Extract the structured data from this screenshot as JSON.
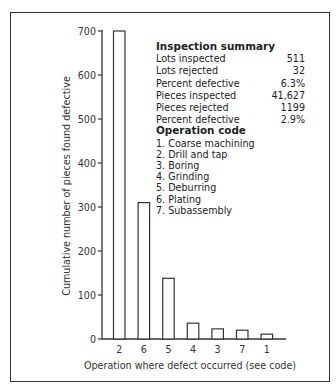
{
  "chart_data": {
    "type": "bar",
    "title": "",
    "xlabel": "Operation where defect occurred (see code)",
    "ylabel": "Cumulative number of pieces found defective",
    "categories": [
      "2",
      "6",
      "5",
      "4",
      "3",
      "7",
      "1"
    ],
    "values": [
      700,
      310,
      138,
      36,
      23,
      20,
      11
    ],
    "ylim": [
      0,
      700
    ],
    "yticks": [
      "0",
      "100",
      "200",
      "300",
      "400",
      "500",
      "600",
      "700"
    ],
    "grid": false,
    "legend": "none"
  },
  "summary": {
    "heading": "Inspection summary",
    "rows": [
      {
        "label": "Lots inspected",
        "value": "511"
      },
      {
        "label": "Lots rejected",
        "value": "32"
      },
      {
        "label": "Percent defective",
        "value": "6.3%"
      },
      {
        "label": "Pieces inspected",
        "value": "41,627"
      },
      {
        "label": "Pieces rejected",
        "value": "1199"
      },
      {
        "label": "Percent defective",
        "value": "2.9%"
      }
    ]
  },
  "operation_code": {
    "heading": "Operation code",
    "items": [
      "1. Coarse machining",
      "2. Drill and tap",
      "3. Boring",
      "4. Grinding",
      "5. Deburring",
      "6. Plating",
      "7. Subassembly"
    ]
  }
}
